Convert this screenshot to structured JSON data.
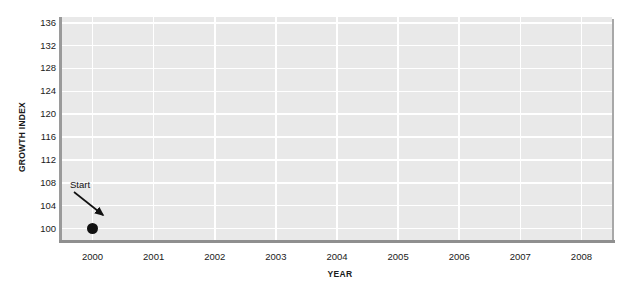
{
  "chart_data": {
    "type": "scatter",
    "title": "",
    "xlabel": "YEAR",
    "ylabel": "GROWTH INDEX",
    "x": [
      2000
    ],
    "values": [
      100
    ],
    "series": [
      {
        "name": "Growth Index",
        "x": [
          2000
        ],
        "values": [
          100
        ]
      }
    ],
    "xtick_labels": [
      "2000",
      "2001",
      "2002",
      "2003",
      "2004",
      "2005",
      "2006",
      "2007",
      "2008"
    ],
    "ytick_labels": [
      "136",
      "132",
      "128",
      "124",
      "120",
      "116",
      "112",
      "108",
      "104",
      "100"
    ],
    "xlim": [
      1999.5,
      2008.5
    ],
    "ylim": [
      98,
      137
    ],
    "grid": true,
    "legend": "none",
    "annotations": [
      {
        "text": "Start",
        "x": 2000,
        "y": 100
      }
    ],
    "colors": {
      "plot_background": "#e9e9e9",
      "gridline": "#ffffff",
      "marker": "#111111",
      "text": "#1a1a1a",
      "frame_shadow": "#9a9a9a",
      "page_background": "#ffffff"
    }
  }
}
